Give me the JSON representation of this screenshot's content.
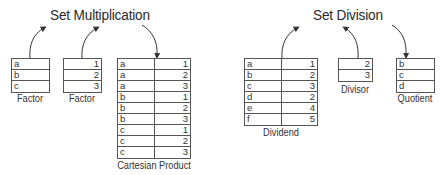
{
  "multiplication": {
    "title": "Set Multiplication",
    "factor1": {
      "label": "Factor",
      "rows": [
        "a",
        "b",
        "c"
      ]
    },
    "factor2": {
      "label": "Factor",
      "rows": [
        "1",
        "2",
        "3"
      ]
    },
    "product": {
      "label": "Cartesian Product",
      "rows": [
        [
          "a",
          "1"
        ],
        [
          "a",
          "2"
        ],
        [
          "a",
          "3"
        ],
        [
          "b",
          "1"
        ],
        [
          "b",
          "2"
        ],
        [
          "b",
          "3"
        ],
        [
          "c",
          "1"
        ],
        [
          "c",
          "2"
        ],
        [
          "c",
          "3"
        ]
      ]
    }
  },
  "division": {
    "title": "Set Division",
    "dividend": {
      "label": "Dividend",
      "rows": [
        [
          "a",
          "1"
        ],
        [
          "b",
          "2"
        ],
        [
          "c",
          "3"
        ],
        [
          "d",
          "2"
        ],
        [
          "e",
          "4"
        ],
        [
          "f",
          "5"
        ]
      ]
    },
    "divisor": {
      "label": "Divisor",
      "rows": [
        "2",
        "3"
      ]
    },
    "quotient": {
      "label": "Quotient",
      "rows": [
        "b",
        "c",
        "d"
      ]
    }
  },
  "colors": {
    "line": "#555555",
    "text": "#333333",
    "background": "#ffffff"
  }
}
